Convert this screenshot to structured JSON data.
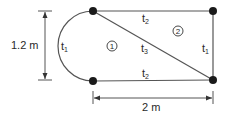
{
  "diagram": {
    "type": "structural cross-section (thin-walled cells)",
    "colors": {
      "line": "#555555",
      "node": "#1a1a1a",
      "text": "#2a2a2a"
    },
    "nodes": [
      {
        "id": "top-left",
        "x": 93,
        "y": 11
      },
      {
        "id": "top-right",
        "x": 213,
        "y": 11
      },
      {
        "id": "bottom-left",
        "x": 93,
        "y": 81
      },
      {
        "id": "bottom-right",
        "x": 213,
        "y": 80
      }
    ],
    "wall_labels": {
      "left_arc": {
        "base": "t",
        "sub": "1"
      },
      "top": {
        "base": "t",
        "sub": "2"
      },
      "diagonal": {
        "base": "t",
        "sub": "3"
      },
      "bottom": {
        "base": "t",
        "sub": "2"
      },
      "right": {
        "base": "t",
        "sub": "1"
      }
    },
    "cells": [
      {
        "label": "①"
      },
      {
        "label": "②"
      }
    ],
    "dimensions": {
      "height": "1.2 m",
      "width": "2 m"
    }
  }
}
